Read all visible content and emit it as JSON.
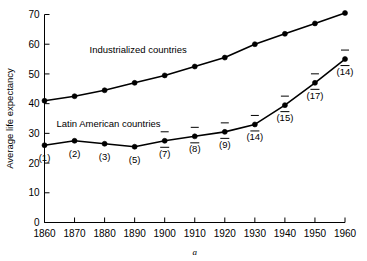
{
  "chart_data": {
    "type": "line",
    "title": "",
    "xlabel": "",
    "ylabel": "Average life expectancy",
    "caption": "a",
    "xlim": [
      1860,
      1960
    ],
    "ylim": [
      0,
      70
    ],
    "grid": false,
    "legend_position": "inline-annotation",
    "x": [
      1860,
      1870,
      1880,
      1890,
      1900,
      1910,
      1920,
      1930,
      1940,
      1950,
      1960
    ],
    "xticklabels": [
      "1860",
      "1870",
      "1880",
      "1890",
      "1900",
      "1910",
      "1920",
      "1930",
      "1940",
      "1950",
      "1960"
    ],
    "yticks": [
      0,
      10,
      20,
      30,
      40,
      50,
      60,
      70
    ],
    "yticklabels": [
      "0",
      "10",
      "20",
      "30",
      "40",
      "50",
      "60",
      "70"
    ],
    "series": [
      {
        "name": "Industrialized countries",
        "label_x": 1875,
        "label_y": 57,
        "values": [
          41,
          42.5,
          44.5,
          47,
          49.5,
          52.5,
          55.5,
          60,
          63.5,
          67,
          70.5
        ],
        "point_labels": [
          "",
          "",
          "",
          "",
          "",
          "",
          "",
          "",
          "",
          "",
          ""
        ]
      },
      {
        "name": "Latin American countries",
        "label_x": 1864,
        "label_y": 32,
        "values": [
          26,
          27.5,
          26.5,
          25.5,
          27.5,
          29,
          30.5,
          33,
          39.5,
          47,
          55
        ],
        "point_labels": [
          "(1)",
          "(2)",
          "(3)",
          "(5)",
          "(7)",
          "(8)",
          "(9)",
          "(14)",
          "(15)",
          "(17)",
          "(14)"
        ],
        "point_labels_overbar": [
          false,
          false,
          false,
          false,
          true,
          true,
          true,
          true,
          true,
          true,
          true
        ]
      }
    ]
  }
}
